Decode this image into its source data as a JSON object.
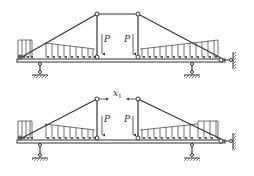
{
  "diagrams": [
    {
      "id": "top",
      "description": "Truss-beam with two point loads P and triangular/rectangular distributed loads",
      "labels": {
        "load_left": "P",
        "load_right": "P"
      }
    },
    {
      "id": "bottom",
      "description": "Same structure with central link removed; relative displacement x1 between hinges",
      "labels": {
        "load_left": "P",
        "load_right": "P",
        "unknown": "x",
        "unknown_sub": "1"
      }
    }
  ],
  "colors": {
    "line": "#333333",
    "background": "#ffffff"
  }
}
